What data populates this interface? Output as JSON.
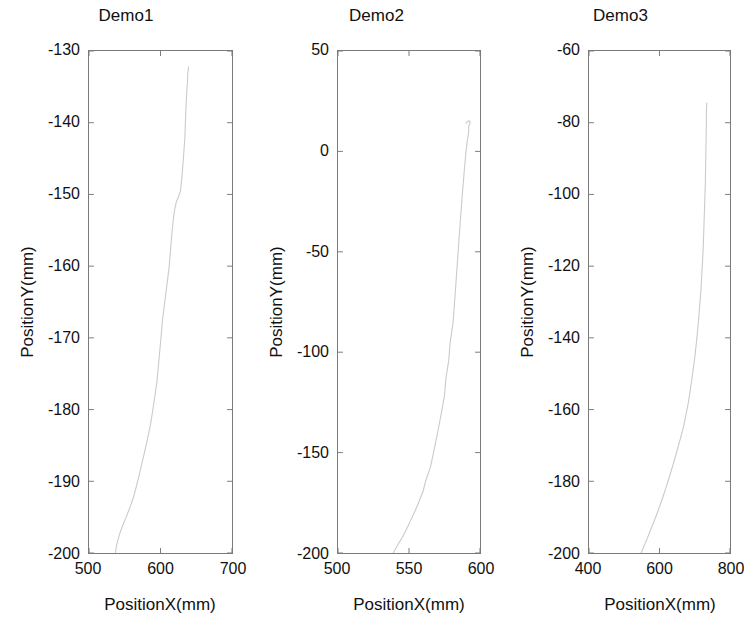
{
  "figure": {
    "background": "#ffffff",
    "line_color": "#c9c9cf",
    "axis_color": "#7a7a7a"
  },
  "chart_data": [
    {
      "type": "line",
      "title": "Demo1",
      "xlabel": "PositionX(mm)",
      "ylabel": "PositionY(mm)",
      "xlim": [
        500,
        700
      ],
      "ylim": [
        -200,
        -130
      ],
      "xticks": [
        500,
        600,
        700
      ],
      "yticks": [
        -200,
        -190,
        -180,
        -170,
        -160,
        -150,
        -140,
        -130
      ],
      "xticklabels": [
        "500",
        "600",
        "700"
      ],
      "yticklabels": [
        "-200",
        "-190",
        "-180",
        "-170",
        "-160",
        "-150",
        "-140",
        "-130"
      ],
      "grid": false,
      "legend": null,
      "series": [
        {
          "name": "trajectory",
          "x": [
            537,
            538,
            540,
            543,
            547,
            552,
            557,
            562,
            566,
            570,
            574,
            578,
            582,
            586,
            589,
            592,
            595,
            597,
            599,
            601,
            603,
            606,
            609,
            612,
            614,
            616,
            618,
            620,
            622,
            625,
            628,
            630,
            632,
            634,
            635,
            636,
            637,
            638,
            638,
            639,
            639
          ],
          "y": [
            -200.0,
            -199.2,
            -198.3,
            -197.3,
            -196.2,
            -195.0,
            -193.7,
            -192.3,
            -190.8,
            -189.2,
            -187.5,
            -185.8,
            -184.0,
            -182.1,
            -180.2,
            -178.2,
            -176.1,
            -174.0,
            -171.8,
            -169.6,
            -167.3,
            -165.0,
            -162.6,
            -160.2,
            -157.8,
            -155.4,
            -153.4,
            -152.0,
            -151.1,
            -150.4,
            -149.5,
            -147.5,
            -145.0,
            -142.3,
            -139.5,
            -137.0,
            -135.2,
            -134.0,
            -133.2,
            -132.6,
            -132.2
          ]
        }
      ]
    },
    {
      "type": "line",
      "title": "Demo2",
      "xlabel": "PositionX(mm)",
      "ylabel": "PositionY(mm)",
      "xlim": [
        500,
        600
      ],
      "ylim": [
        -200,
        50
      ],
      "xticks": [
        500,
        550,
        600
      ],
      "yticks": [
        -200,
        -150,
        -100,
        -50,
        0,
        50
      ],
      "xticklabels": [
        "500",
        "550",
        "600"
      ],
      "yticklabels": [
        "-200",
        "-150",
        "-100",
        "-50",
        "0",
        "50"
      ],
      "grid": false,
      "legend": null,
      "series": [
        {
          "name": "trajectory",
          "x": [
            539,
            540,
            542,
            545,
            548,
            551,
            554,
            557,
            560,
            562,
            565,
            567,
            569,
            571,
            573,
            575,
            576,
            578,
            579,
            581,
            582,
            583,
            584,
            585,
            586,
            587,
            588,
            589,
            590,
            591,
            592,
            592,
            593,
            593,
            592,
            591,
            590
          ],
          "y": [
            -200.0,
            -198.5,
            -196.0,
            -192.5,
            -188.5,
            -184.0,
            -179.5,
            -174.5,
            -169.0,
            -163.5,
            -157.5,
            -151.0,
            -144.0,
            -137.0,
            -129.5,
            -121.5,
            -113.0,
            -104.0,
            -95.0,
            -85.5,
            -76.0,
            -66.0,
            -56.0,
            -46.0,
            -36.0,
            -26.5,
            -17.5,
            -9.0,
            -1.0,
            5.0,
            9.5,
            12.5,
            14.0,
            15.0,
            15.2,
            14.8,
            14.0
          ]
        }
      ]
    },
    {
      "type": "line",
      "title": "Demo3",
      "xlabel": "PositionX(mm)",
      "ylabel": "PositionY(mm)",
      "xlim": [
        400,
        800
      ],
      "ylim": [
        -200,
        -60
      ],
      "xticks": [
        400,
        600,
        800
      ],
      "yticks": [
        -200,
        -180,
        -160,
        -140,
        -120,
        -100,
        -80,
        -60
      ],
      "xticklabels": [
        "400",
        "600",
        "800"
      ],
      "yticklabels": [
        "-200",
        "-180",
        "-160",
        "-140",
        "-120",
        "-100",
        "-80",
        "-60"
      ],
      "grid": false,
      "legend": null,
      "series": [
        {
          "name": "trajectory",
          "x": [
            548,
            552,
            558,
            565,
            572,
            580,
            588,
            596,
            604,
            612,
            620,
            628,
            636,
            644,
            652,
            660,
            668,
            675,
            682,
            688,
            694,
            700,
            705,
            710,
            714,
            718,
            721,
            724,
            726,
            728,
            730,
            731,
            732,
            733,
            733,
            734
          ],
          "y": [
            -200.0,
            -199.0,
            -197.6,
            -196.0,
            -194.2,
            -192.3,
            -190.3,
            -188.2,
            -186.0,
            -183.7,
            -181.3,
            -178.8,
            -176.2,
            -173.5,
            -170.7,
            -167.8,
            -164.8,
            -161.5,
            -158.0,
            -154.0,
            -150.0,
            -145.5,
            -141.0,
            -136.0,
            -131.0,
            -126.0,
            -120.5,
            -115.0,
            -109.0,
            -103.0,
            -97.0,
            -91.0,
            -85.5,
            -80.5,
            -77.0,
            -74.5
          ]
        }
      ]
    }
  ]
}
